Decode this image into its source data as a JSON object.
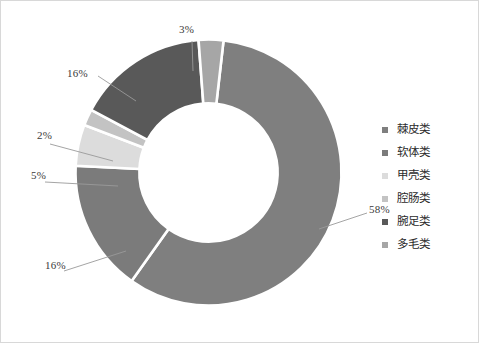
{
  "chart_data": {
    "type": "pie",
    "variant": "doughnut",
    "title": "",
    "subtitle": "",
    "xlabel": "",
    "ylabel": "",
    "grid": false,
    "legend_position": "right",
    "hole_ratio": 0.52,
    "start_angle_deg": 0,
    "direction": "clockwise",
    "units": "%",
    "categories": [
      "棘皮类",
      "软体类",
      "甲壳类",
      "腔肠类",
      "腕足类",
      "多毛类"
    ],
    "values": [
      58,
      16,
      5,
      2,
      16,
      3
    ],
    "data_labels": [
      "58%",
      "16%",
      "5%",
      "2%",
      "16%",
      "3%"
    ],
    "colors": [
      "#7f7f7f",
      "#7b7b7b",
      "#dcdcdc",
      "#c3c3c3",
      "#595959",
      "#a6a6a6"
    ],
    "slices": [
      {
        "label": "棘皮类",
        "value": 58,
        "data_label": "58%",
        "color": "#7f7f7f"
      },
      {
        "label": "软体类",
        "value": 16,
        "data_label": "16%",
        "color": "#7b7b7b"
      },
      {
        "label": "甲壳类",
        "value": 5,
        "data_label": "5%",
        "color": "#dcdcdc"
      },
      {
        "label": "腔肠类",
        "value": 2,
        "data_label": "2%",
        "color": "#c3c3c3"
      },
      {
        "label": "腕足类",
        "value": 16,
        "data_label": "16%",
        "color": "#595959"
      },
      {
        "label": "多毛类",
        "value": 3,
        "data_label": "3%",
        "color": "#a6a6a6"
      }
    ]
  },
  "labels": {
    "top": "3%",
    "upper_left": "16%",
    "mid_left_upper": "2%",
    "mid_left_lower": "5%",
    "lower_left": "16%",
    "right": "58%"
  },
  "legend": {
    "items": [
      {
        "label": "棘皮类",
        "color": "#7f7f7f"
      },
      {
        "label": "软体类",
        "color": "#7b7b7b"
      },
      {
        "label": "甲壳类",
        "color": "#dcdcdc"
      },
      {
        "label": "腔肠类",
        "color": "#c3c3c3"
      },
      {
        "label": "腕足类",
        "color": "#595959"
      },
      {
        "label": "多毛类",
        "color": "#a6a6a6"
      }
    ]
  },
  "style": {
    "background": "#ffffff",
    "border": "#d8d8d8",
    "slice_gap_color": "#ffffff",
    "leader_line_color": "#9a9a9a",
    "label_text_color": "#3a3a3a"
  }
}
